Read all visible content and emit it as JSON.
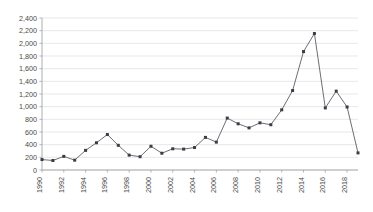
{
  "chart_data": {
    "type": "line",
    "title": "",
    "subtitle": "",
    "xlabel": "",
    "ylabel": "",
    "x": [
      1990,
      1991,
      1992,
      1993,
      1994,
      1995,
      1996,
      1997,
      1998,
      1999,
      2000,
      2001,
      2002,
      2003,
      2004,
      2005,
      2006,
      2007,
      2008,
      2009,
      2010,
      2011,
      2012,
      2013,
      2014,
      2015,
      2016,
      2017,
      2018,
      2019
    ],
    "values": [
      165,
      150,
      215,
      155,
      310,
      430,
      560,
      390,
      235,
      210,
      375,
      265,
      335,
      330,
      355,
      515,
      440,
      820,
      730,
      665,
      745,
      715,
      950,
      1255,
      1870,
      2155,
      980,
      1245,
      995,
      270
    ],
    "series": [
      {
        "name": "series-1",
        "values": [
          165,
          150,
          215,
          155,
          310,
          430,
          560,
          390,
          235,
          210,
          375,
          265,
          335,
          330,
          355,
          515,
          440,
          820,
          730,
          665,
          745,
          715,
          950,
          1255,
          1870,
          2155,
          980,
          1245,
          995,
          270
        ],
        "color": "#5c5c66",
        "marker": "square"
      }
    ],
    "ylim": [
      0,
      2400
    ],
    "xlim": [
      1990,
      2019
    ],
    "ytick_step": 200,
    "ytick_labels": [
      "0",
      "200",
      "400",
      "600",
      "800",
      "1,000",
      "1,200",
      "1,400",
      "1,600",
      "1,800",
      "2,000",
      "2,200",
      "2,400"
    ],
    "ytick_values": [
      0,
      200,
      400,
      600,
      800,
      1000,
      1200,
      1400,
      1600,
      1800,
      2000,
      2200,
      2400
    ],
    "xtick_labels": [
      "1990",
      "1992",
      "1994",
      "1996",
      "1998",
      "2000",
      "2002",
      "2004",
      "2006",
      "2008",
      "2010",
      "2012",
      "2014",
      "2016",
      "2018"
    ],
    "xtick_values": [
      1990,
      1992,
      1994,
      1996,
      1998,
      2000,
      2002,
      2004,
      2006,
      2008,
      2010,
      2012,
      2014,
      2016,
      2018
    ],
    "xtick_rotation": -90,
    "grid": {
      "horizontal": true,
      "vertical": false,
      "color": "#d9d9d9"
    },
    "legend": {
      "visible": false,
      "position": "none",
      "entries": []
    },
    "annotations": [],
    "colors": {
      "line": "#5c5c66",
      "marker": "#3c3c46",
      "gridline": "#d9d9d9",
      "axis": "#9a9a9a",
      "tick_text": "#4a4a4a",
      "background": "#ffffff"
    }
  }
}
